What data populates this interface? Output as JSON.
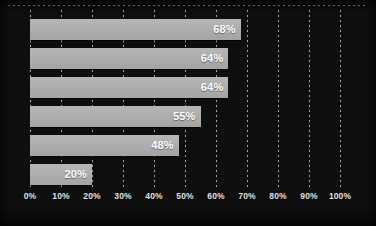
{
  "chart_data": {
    "type": "bar",
    "orientation": "horizontal",
    "title": "",
    "subtitle": "",
    "xlabel": "",
    "ylabel": "",
    "categories": [
      "",
      "",
      "",
      "",
      "",
      ""
    ],
    "values": [
      68,
      64,
      64,
      55,
      48,
      20
    ],
    "data_labels": [
      "68%",
      "64%",
      "64%",
      "55%",
      "48%",
      "20%"
    ],
    "xlim": [
      0,
      100
    ],
    "xticks": [
      0,
      10,
      20,
      30,
      40,
      50,
      60,
      70,
      80,
      90,
      100
    ],
    "xtick_labels": [
      "0%",
      "10%",
      "20%",
      "30%",
      "40%",
      "50%",
      "60%",
      "70%",
      "80%",
      "90%",
      "100%"
    ],
    "grid": "vertical-dotted",
    "legend": null,
    "legend_position": "none",
    "colors": {
      "background": "#0d0d0d",
      "bar_fill": "#aeaeae",
      "data_label": "#ffffff",
      "tick_label": "#e2e2e2",
      "gridline": "#e1e1e1"
    }
  },
  "axis": {
    "ticks": [
      {
        "label": "0%",
        "value": 0
      },
      {
        "label": "10%",
        "value": 10
      },
      {
        "label": "20%",
        "value": 20
      },
      {
        "label": "30%",
        "value": 30
      },
      {
        "label": "40%",
        "value": 40
      },
      {
        "label": "50%",
        "value": 50
      },
      {
        "label": "60%",
        "value": 60
      },
      {
        "label": "70%",
        "value": 70
      },
      {
        "label": "80%",
        "value": 80
      },
      {
        "label": "90%",
        "value": 90
      },
      {
        "label": "100%",
        "value": 100
      }
    ]
  },
  "bars": [
    {
      "label": "68%",
      "value": 68
    },
    {
      "label": "64%",
      "value": 64
    },
    {
      "label": "64%",
      "value": 64
    },
    {
      "label": "55%",
      "value": 55
    },
    {
      "label": "48%",
      "value": 48
    },
    {
      "label": "20%",
      "value": 20
    }
  ]
}
